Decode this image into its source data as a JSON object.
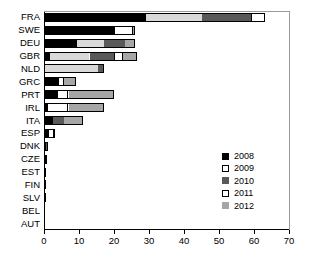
{
  "chart_data": {
    "type": "bar",
    "orientation": "horizontal",
    "stacked": true,
    "title": "",
    "xlabel": "",
    "ylabel": "",
    "xlim": [
      0,
      70
    ],
    "xticks": [
      0,
      10,
      20,
      30,
      40,
      50,
      60,
      70
    ],
    "grid": false,
    "legend_position": "inner-right",
    "categories": [
      "FRA",
      "SWE",
      "DEU",
      "GBR",
      "NLD",
      "GRC",
      "PRT",
      "IRL",
      "ITA",
      "ESP",
      "DNK",
      "CZE",
      "EST",
      "FIN",
      "SLV",
      "BEL",
      "AUT"
    ],
    "series": [
      {
        "name": "2008",
        "color": "#000000",
        "values": [
          29.0,
          20.0,
          9.5,
          1.7,
          0.0,
          4.0,
          3.7,
          0.9,
          2.5,
          1.2,
          0.7,
          0.6,
          0.0,
          0.0,
          0.4,
          0.0,
          0.0
        ]
      },
      {
        "name": "2009",
        "color": "#d9d9d9",
        "values": [
          16.0,
          0.0,
          7.5,
          11.3,
          15.5,
          0.0,
          0.0,
          0.0,
          0.0,
          0.0,
          0.0,
          0.0,
          0.0,
          0.0,
          0.0,
          0.0,
          0.0
        ]
      },
      {
        "name": "2010",
        "color": "#595959",
        "values": [
          14.0,
          0.0,
          6.0,
          7.0,
          1.5,
          0.0,
          0.0,
          0.0,
          3.2,
          0.0,
          0.3,
          0.0,
          0.4,
          0.3,
          0.0,
          0.0,
          0.0
        ]
      },
      {
        "name": "2011",
        "color": "#ffffff",
        "values": [
          4.0,
          5.5,
          0.0,
          2.5,
          0.0,
          1.7,
          3.3,
          6.1,
          0.0,
          1.8,
          0.0,
          0.0,
          0.0,
          0.0,
          0.0,
          0.0,
          0.0
        ]
      },
      {
        "name": "2012",
        "color": "#a6a6a6",
        "values": [
          0.0,
          0.5,
          3.0,
          4.0,
          0.0,
          3.3,
          13.0,
          10.0,
          5.3,
          0.0,
          0.0,
          0.3,
          0.0,
          0.0,
          0.0,
          0.0,
          0.0
        ]
      }
    ],
    "totals": [
      63.0,
      26.0,
      26.0,
      26.5,
      17.0,
      9.0,
      20.0,
      17.0,
      11.0,
      3.0,
      1.0,
      0.9,
      0.4,
      0.3,
      0.4,
      0.0,
      0.0
    ],
    "legend": [
      "2008",
      "2009",
      "2010",
      "2011",
      "2012"
    ]
  }
}
